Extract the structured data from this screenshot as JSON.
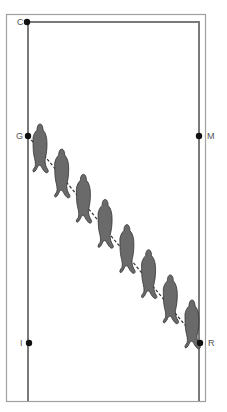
{
  "diagram": {
    "type": "dressage-arena-exercise",
    "colors": {
      "outer_border": "#9a9a9a",
      "inner_track": "#7a7a7a",
      "markers": "#111111",
      "horse": "#6a6a6a",
      "horse_outline": "#333333",
      "dashed_path": "#333333",
      "label": "#555555"
    },
    "markers": [
      {
        "letter": "C",
        "x": 27,
        "y": 22,
        "label_side": "left"
      },
      {
        "letter": "G",
        "x": 28,
        "y": 136,
        "label_side": "left"
      },
      {
        "letter": "M",
        "x": 199,
        "y": 136,
        "label_side": "right"
      },
      {
        "letter": "I",
        "x": 29,
        "y": 343,
        "label_side": "left"
      },
      {
        "letter": "R",
        "x": 200,
        "y": 343,
        "label_side": "right"
      }
    ],
    "path": {
      "from": "G",
      "to": "R",
      "style": "dashed"
    },
    "horse_count": 8
  }
}
